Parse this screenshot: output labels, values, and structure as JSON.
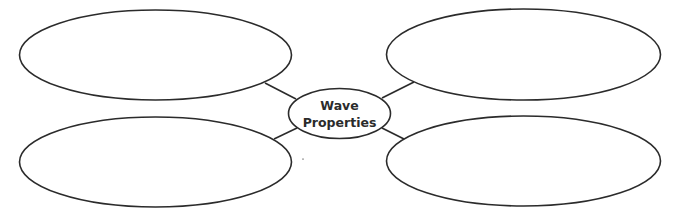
{
  "diagram": {
    "type": "concept-map",
    "center": {
      "label_line1": "Wave",
      "label_line2": "Properties"
    },
    "branches": [
      {
        "position": "top-left",
        "text": ""
      },
      {
        "position": "top-right",
        "text": ""
      },
      {
        "position": "bottom-left",
        "text": ""
      },
      {
        "position": "bottom-right",
        "text": ""
      }
    ],
    "colors": {
      "stroke": "#2b2b2b",
      "background": "#ffffff"
    }
  }
}
